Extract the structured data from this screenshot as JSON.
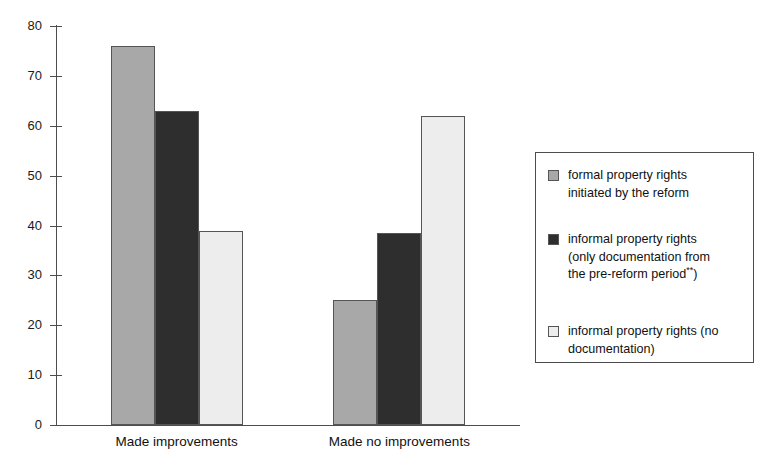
{
  "chart_data": {
    "type": "bar",
    "title": "",
    "subtitle": "",
    "xlabel": "",
    "ylabel": "",
    "ylim": [
      0,
      80
    ],
    "ytick_step": 10,
    "yticks": [
      80,
      70,
      60,
      50,
      40,
      30,
      20,
      10,
      0
    ],
    "grid": false,
    "legend_position": "right",
    "categories": [
      "Made improvements",
      "Made no improvements"
    ],
    "series": [
      {
        "name": "formal property rights initiated by the reform",
        "color": "#a8a8a8",
        "values": [
          76,
          25
        ]
      },
      {
        "name": "informal property rights (only documentation from the pre-reform period**)",
        "color": "#2e2e2e",
        "values": [
          63,
          38.5
        ]
      },
      {
        "name": "informal property rights (no documentation)",
        "color": "#ededed",
        "values": [
          39,
          62
        ]
      }
    ]
  },
  "axis": {
    "y_tick_labels": [
      "80",
      "70",
      "60",
      "50",
      "40",
      "30",
      "20",
      "10",
      "0"
    ]
  },
  "categories": [
    {
      "label": "Made improvements"
    },
    {
      "label": "Made no improvements"
    }
  ],
  "legend": {
    "entries": [
      {
        "color": "#a8a8a8",
        "line1": "formal property rights",
        "line2": "initiated by the reform",
        "line3": "",
        "has_footnote": false
      },
      {
        "color": "#2e2e2e",
        "line1": "informal property rights",
        "line2": "(only documentation from",
        "line3": "the pre-reform period",
        "footnote": "**",
        "line3_tail": ")",
        "has_footnote": true
      },
      {
        "color": "#ededed",
        "line1": "informal property rights (no",
        "line2": "documentation)",
        "line3": "",
        "has_footnote": false
      }
    ]
  },
  "colors": {
    "series_1": "#a8a8a8",
    "series_2": "#2e2e2e",
    "series_3": "#ededed",
    "axis": "#4d4d4d",
    "text": "#111111",
    "background": "#ffffff"
  }
}
